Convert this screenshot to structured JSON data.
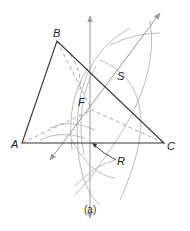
{
  "figure": {
    "caption": "(a)",
    "colors": {
      "triangle": "#333333",
      "construction": "#aaaaaa",
      "arrow": "#999999",
      "dashed": "#aaaaaa"
    },
    "vertices": {
      "A": {
        "label": "A",
        "x": 22,
        "y": 143
      },
      "B": {
        "label": "B",
        "x": 57,
        "y": 41
      },
      "C": {
        "label": "C",
        "x": 164,
        "y": 143
      }
    },
    "points": {
      "S": {
        "label": "S"
      },
      "F": {
        "label": "F"
      },
      "R": {
        "label": "R"
      }
    }
  }
}
